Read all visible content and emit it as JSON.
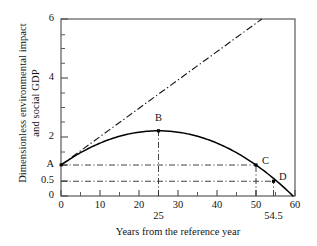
{
  "chart_data": {
    "type": "line",
    "title": "",
    "xlabel": "Years from the reference year",
    "ylabel_line1": "Dimensionless environmental impact",
    "ylabel_line2": "and social GDP",
    "xlim": [
      0,
      60
    ],
    "ylim": [
      0,
      6
    ],
    "grid": false,
    "legend": "none",
    "xticks": [
      {
        "value": 0,
        "label": "0"
      },
      {
        "value": 10,
        "label": "10"
      },
      {
        "value": 20,
        "label": "20"
      },
      {
        "value": 30,
        "label": "30"
      },
      {
        "value": 40,
        "label": "40"
      },
      {
        "value": 50,
        "label": "50"
      },
      {
        "value": 60,
        "label": "60"
      }
    ],
    "xticks_minor": [
      5,
      15,
      25,
      35,
      45,
      55
    ],
    "xticks_annotated": [
      {
        "value": 25,
        "label": "25"
      },
      {
        "value": 54.5,
        "label": "54.5"
      }
    ],
    "yticks": [
      {
        "value": 0,
        "label": "0"
      },
      {
        "value": 0.5,
        "label": "0.5"
      },
      {
        "value": 1.05,
        "label": "A"
      },
      {
        "value": 2,
        "label": "2"
      },
      {
        "value": 4,
        "label": "4"
      },
      {
        "value": 6,
        "label": "6"
      }
    ],
    "yticks_minor": [
      1.5,
      2.5,
      3,
      3.5,
      4.5,
      5,
      5.5
    ],
    "series": [
      {
        "name": "environmental-impact-curve",
        "style": "solid",
        "points": [
          [
            0,
            1.05
          ],
          [
            5,
            1.52
          ],
          [
            10,
            1.85
          ],
          [
            15,
            2.07
          ],
          [
            20,
            2.18
          ],
          [
            25,
            2.21
          ],
          [
            30,
            2.15
          ],
          [
            35,
            1.98
          ],
          [
            40,
            1.72
          ],
          [
            45,
            1.42
          ],
          [
            50,
            1.05
          ],
          [
            54.5,
            0.5
          ],
          [
            58,
            0.0
          ]
        ]
      },
      {
        "name": "social-gdp-line",
        "style": "dash-dot",
        "points": [
          [
            0,
            1.05
          ],
          [
            51.5,
            6.0
          ]
        ]
      }
    ],
    "markers": [
      {
        "label": "B",
        "x": 25,
        "y": 2.21
      },
      {
        "label": "C",
        "x": 50,
        "y": 1.05
      },
      {
        "label": "D",
        "x": 54.5,
        "y": 0.5
      }
    ],
    "guides": [
      {
        "name": "horizontal-guide-A",
        "orientation": "horizontal",
        "value": 1.05,
        "from": 0,
        "to": 50
      },
      {
        "name": "horizontal-guide-half",
        "orientation": "horizontal",
        "value": 0.5,
        "from": 0,
        "to": 54.5
      },
      {
        "name": "vertical-guide-B",
        "orientation": "vertical",
        "value": 25,
        "from": 0,
        "to": 2.21
      },
      {
        "name": "vertical-guide-C",
        "orientation": "vertical",
        "value": 50,
        "from": 0,
        "to": 1.05
      },
      {
        "name": "vertical-guide-D",
        "orientation": "vertical",
        "value": 54.5,
        "from": 0,
        "to": 0.5
      }
    ],
    "colors": {
      "axis": "#3a3a3a",
      "curve": "#000000",
      "guide": "#2b2b2b",
      "text": "#141414",
      "background": "#ffffff"
    }
  }
}
